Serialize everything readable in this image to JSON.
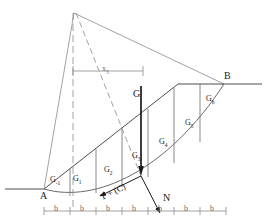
{
  "figure": {
    "type": "slope-stability-method-of-slices-diagram",
    "background_color": "#ffffff",
    "stroke_color": "#4d4d4d",
    "heavy_stroke_color": "#1a1a1a",
    "text_color": "#1a1a1a"
  },
  "points": {
    "A": {
      "label": "A",
      "x": 44,
      "y": 189
    },
    "B": {
      "label": "B",
      "x": 224,
      "y": 82
    },
    "apex": {
      "x": 74,
      "y": 13
    }
  },
  "labels": {
    "point_a": "A",
    "point_b": "B",
    "resultant_weight": "G",
    "normal_force": "N",
    "tangential_force": "T + (C)",
    "lever_arm": "x",
    "lever_arm_sub": "3",
    "slice_width": "b"
  },
  "slices": [
    {
      "name": "G",
      "sub": "-1",
      "cx": 57,
      "cy": 181
    },
    {
      "name": "G",
      "sub": "1",
      "cx": 79,
      "cy": 180
    },
    {
      "name": "G",
      "sub": "2",
      "cx": 110,
      "cy": 172
    },
    {
      "name": "G",
      "sub": "3",
      "cx": 139,
      "cy": 160
    },
    {
      "name": "G",
      "sub": "4",
      "cx": 165,
      "cy": 144
    },
    {
      "name": "G",
      "sub": "5",
      "cx": 191,
      "cy": 125
    },
    {
      "name": "G",
      "sub": "6",
      "cx": 212,
      "cy": 101
    }
  ],
  "dimension_line": {
    "label": "b",
    "count": 7,
    "y": 211,
    "ticks": [
      44,
      70,
      96,
      122,
      148,
      174,
      200,
      226
    ],
    "segment_labels": [
      "b",
      "b",
      "b",
      "b",
      "b",
      "b",
      "b"
    ]
  },
  "lever_dimension": {
    "label": "x",
    "subscript": "3",
    "y": 71,
    "x_start": 73,
    "x_end": 143
  },
  "ground": {
    "left_line_y": 189,
    "left_line_x_start": 5,
    "left_line_x_end": 44,
    "right_line_y": 84,
    "right_line_x_start": 222,
    "right_line_x_end": 262,
    "plateau_y": 84,
    "plateau_x_start": 178,
    "plateau_x_end": 224
  }
}
